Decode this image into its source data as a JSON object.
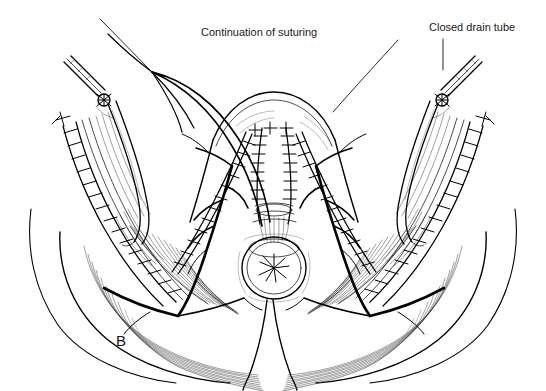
{
  "figure": {
    "panel_letter": "B",
    "background_color": "#ffffff",
    "ink_color": "#000000",
    "width": 546,
    "height": 391,
    "style": "black-and-white medical line drawing"
  },
  "annotations": [
    {
      "id": "continuation-of-suturing",
      "label": "Continuation of suturing",
      "text_x": 201,
      "text_y": 36,
      "leader": "M 100,19 L 152,72",
      "points_to": "suture needle and running suture at midline"
    },
    {
      "id": "closed-drain-tube",
      "label": "Closed drain tube",
      "text_x": 429,
      "text_y": 31,
      "leader": "M 443,39 L 443,70",
      "points_to": "right closed suction drain exiting skin"
    }
  ],
  "structures": [
    {
      "name": "left-drain-tube",
      "type": "closed suction drain",
      "side": "left"
    },
    {
      "name": "right-drain-tube",
      "type": "closed suction drain",
      "side": "right"
    },
    {
      "name": "left-suture-line",
      "type": "interrupted sutures",
      "side": "left"
    },
    {
      "name": "right-suture-line",
      "type": "interrupted sutures",
      "side": "right"
    },
    {
      "name": "midline-suture-line",
      "type": "running suture",
      "side": "center"
    },
    {
      "name": "anal-orifice",
      "type": "anus",
      "side": "center"
    },
    {
      "name": "gluteal-muscle-left",
      "type": "gluteus maximus fibers",
      "side": "left"
    },
    {
      "name": "gluteal-muscle-right",
      "type": "gluteus maximus fibers",
      "side": "right"
    },
    {
      "name": "suture-needle",
      "type": "curved surgical needle",
      "side": "center"
    }
  ]
}
